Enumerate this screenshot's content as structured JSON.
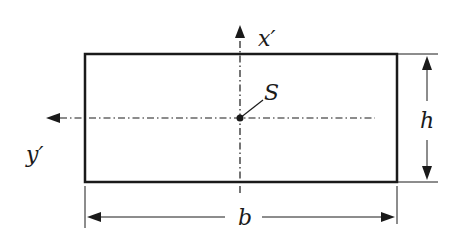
{
  "diagram": {
    "type": "rectangular cross-section",
    "labels": {
      "axis_vertical": "x′",
      "axis_horizontal": "y′",
      "centroid": "S",
      "width": "b",
      "height": "h"
    },
    "colors": {
      "line": "#1a1a1a",
      "background": "#ffffff"
    }
  }
}
